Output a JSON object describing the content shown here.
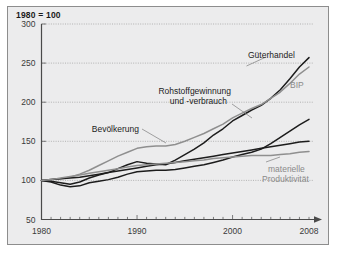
{
  "chart_data": {
    "type": "line",
    "title": "1980 = 100",
    "xlabel": "",
    "ylabel": "",
    "xlim": [
      1980,
      2008
    ],
    "ylim": [
      50,
      300
    ],
    "yticks": [
      50,
      100,
      150,
      200,
      250,
      300
    ],
    "xticks": [
      1980,
      1990,
      2000,
      2008
    ],
    "xtick_labels": [
      "1980",
      "1990",
      "2000",
      "2008"
    ],
    "ytick_labels": [
      "50",
      "100",
      "150",
      "200",
      "250",
      "300"
    ],
    "grid": "horizontal-dotted",
    "legend": "inline-annotations",
    "x": [
      1980,
      1981,
      1982,
      1983,
      1984,
      1985,
      1986,
      1987,
      1988,
      1989,
      1990,
      1991,
      1992,
      1993,
      1994,
      1995,
      1996,
      1997,
      1998,
      1999,
      2000,
      2001,
      2002,
      2003,
      2004,
      2005,
      2006,
      2007,
      2008
    ],
    "series": [
      {
        "name": "Güterhandel",
        "color": "#1c1c1c",
        "values": [
          100,
          99,
          97,
          95,
          98,
          103,
          107,
          110,
          115,
          120,
          124,
          122,
          121,
          120,
          126,
          133,
          140,
          148,
          158,
          166,
          176,
          183,
          190,
          196,
          205,
          216,
          230,
          245,
          257
        ]
      },
      {
        "name": "BIP",
        "color": "#8f8f8f",
        "values": [
          100,
          101,
          102,
          104,
          108,
          113,
          119,
          125,
          131,
          136,
          141,
          143,
          144,
          144,
          146,
          150,
          155,
          160,
          166,
          172,
          180,
          186,
          192,
          197,
          205,
          213,
          224,
          236,
          245
        ]
      },
      {
        "name": "Rohstoffgewinnung und -verbrauch",
        "color": "#1c1c1c",
        "values": [
          100,
          98,
          94,
          92,
          93,
          97,
          99,
          101,
          104,
          108,
          111,
          112,
          113,
          113,
          114,
          116,
          118,
          120,
          123,
          126,
          130,
          133,
          136,
          140,
          147,
          155,
          163,
          171,
          178
        ]
      },
      {
        "name": "Bevölkerung",
        "color": "#1c1c1c",
        "values": [
          100,
          101,
          102,
          103,
          104,
          106,
          108,
          110,
          112,
          114,
          116,
          118,
          120,
          121,
          123,
          125,
          127,
          129,
          131,
          133,
          135,
          137,
          139,
          141,
          143,
          145,
          147,
          149,
          150
        ]
      },
      {
        "name": "materielle Produktivität",
        "color": "#8f8f8f",
        "values": [
          100,
          101,
          103,
          105,
          107,
          109,
          111,
          113,
          115,
          117,
          119,
          120,
          121,
          122,
          123,
          124,
          125,
          126,
          128,
          129,
          130,
          131,
          132,
          132,
          132,
          133,
          134,
          136,
          137
        ]
      }
    ],
    "annotations": [
      {
        "text": "Güterhandel",
        "series": "Güterhandel",
        "color": "dark"
      },
      {
        "text": "BIP",
        "series": "BIP",
        "color": "gray"
      },
      {
        "text_line1": "Rohstoffgewinnung",
        "text_line2": "und -verbrauch",
        "series": "Rohstoffgewinnung und -verbrauch",
        "color": "dark"
      },
      {
        "text": "Bevölkerung",
        "series": "Bevölkerung",
        "color": "dark"
      },
      {
        "text_line1": "materielle",
        "text_line2": "Produktivität",
        "series": "materielle Produktivität",
        "color": "gray"
      }
    ]
  }
}
